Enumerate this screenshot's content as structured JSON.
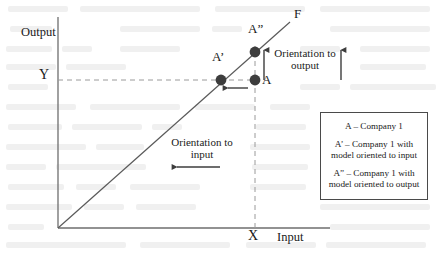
{
  "figure": {
    "type": "diagram"
  },
  "axes": {
    "y_axis_label": "Output",
    "x_axis_label": "Input",
    "y_tick_label": "Y",
    "x_tick_label": "X",
    "origin": {
      "x": 58,
      "y": 228
    }
  },
  "frontier": {
    "label": "F",
    "from": {
      "x": 58,
      "y": 228
    },
    "to": {
      "x": 290,
      "y": 22
    }
  },
  "points": [
    {
      "name": "A",
      "label": "A",
      "cx": 255,
      "cy": 80,
      "r": 5.4,
      "fill": "#3d3d3d"
    },
    {
      "name": "A1",
      "label": "A’",
      "cx": 221,
      "cy": 80,
      "r": 5.4,
      "fill": "#3d3d3d"
    },
    {
      "name": "A2",
      "label": "A”",
      "cx": 255,
      "cy": 52,
      "r": 5.4,
      "fill": "#3d3d3d"
    }
  ],
  "annotations": {
    "orientation_output": "Orientation to\noutput",
    "orientation_input": "Orientation to\ninput"
  },
  "legend": {
    "entries": [
      "A – Company 1",
      "A’ – Company 1 with\nmodel oriented to input",
      "A” – Company 1 with\nmodel oriented to output"
    ]
  },
  "colors": {
    "ink": "#3d3d3d",
    "dashed": "#9a9a9a",
    "page": "#ffffff"
  }
}
